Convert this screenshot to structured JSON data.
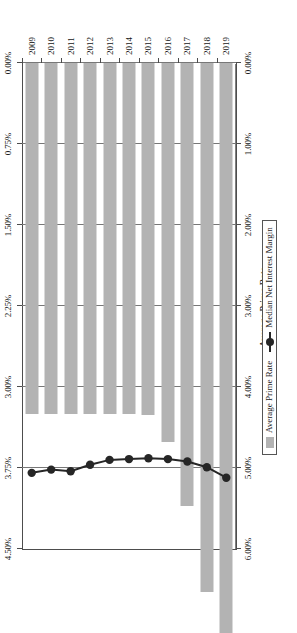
{
  "chart": {
    "title": "",
    "legend": {
      "position": "bottom",
      "entries": [
        {
          "label": "Average Prime Rate",
          "marker": "bar-swatch",
          "color": "#b3b3b3"
        },
        {
          "label": "Median Net Interest Margin",
          "marker": "line-marker",
          "color": "#262626"
        }
      ]
    },
    "primary_axis": {
      "title": "Average Prime Rate",
      "ticks": [
        "6.00%",
        "5.00%",
        "4.00%",
        "3.00%",
        "2.00%",
        "1.00%",
        "0.00%"
      ]
    },
    "secondary_axis": {
      "title": "Net Interest Margin",
      "ticks": [
        "4.50%",
        "3.75%",
        "3.00%",
        "2.25%",
        "1.50%",
        "0.75%",
        "0.00%"
      ]
    }
  },
  "chart_data": {
    "type": "bar",
    "orientation": "rotated-90-ccw",
    "title": "",
    "xlabel": "",
    "ylabel": "Average Prime Rate",
    "y2label": "Net Interest Margin",
    "categories": [
      "2009",
      "2010",
      "2011",
      "2012",
      "2013",
      "2014",
      "2015",
      "2016",
      "2017",
      "2018",
      "2019"
    ],
    "grid": true,
    "ylim": [
      0,
      6
    ],
    "y2lim": [
      0,
      4.5
    ],
    "yticks": [
      6,
      5,
      4,
      3,
      2,
      1,
      0
    ],
    "ytick_labels": [
      "6.00%",
      "5.00%",
      "4.00%",
      "3.00%",
      "2.00%",
      "1.00%",
      "0.00%"
    ],
    "y2ticks": [
      4.5,
      3.75,
      3.0,
      2.25,
      1.5,
      0.75,
      0
    ],
    "y2tick_labels": [
      "4.50%",
      "3.75%",
      "3.00%",
      "2.25%",
      "1.50%",
      "0.75%",
      "0.00%"
    ],
    "legend_position": "bottom",
    "series": [
      {
        "name": "Average Prime Rate",
        "type": "bar",
        "axis": "secondary",
        "unit": "%",
        "color": "#b3b3b3",
        "values": [
          3.25,
          3.25,
          3.25,
          3.25,
          3.25,
          3.25,
          3.26,
          3.51,
          4.1,
          4.9,
          5.28
        ]
      },
      {
        "name": "Median Net Interest Margin",
        "type": "line",
        "axis": "primary",
        "unit": "%",
        "color": "#262626",
        "values": [
          5.06,
          5.02,
          5.04,
          4.96,
          4.9,
          4.89,
          4.88,
          4.89,
          4.92,
          4.99,
          5.12
        ]
      }
    ]
  }
}
